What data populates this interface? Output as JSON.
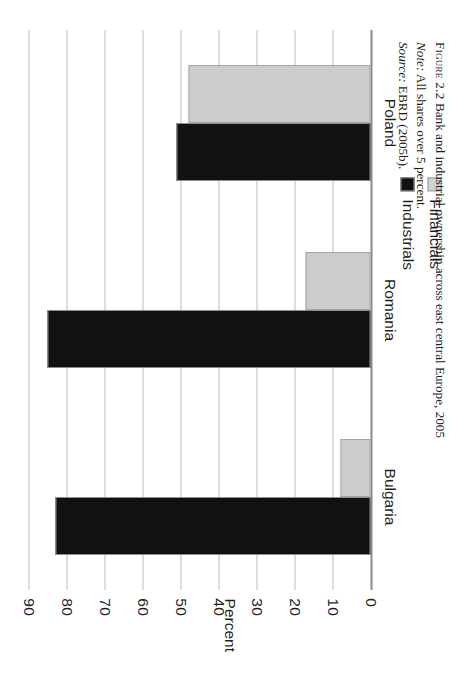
{
  "chart_data": {
    "type": "bar",
    "orientation": "horizontal",
    "title": "Bank and industrial ownership across east central Europe, 2005",
    "categories": [
      "Poland",
      "Romania",
      "Bulgaria"
    ],
    "series": [
      {
        "name": "Industrials",
        "color": "#111111",
        "values": [
          51,
          85,
          83
        ]
      },
      {
        "name": "Financials",
        "color": "#cccccc",
        "values": [
          48,
          17,
          8
        ]
      }
    ],
    "xlabel": "",
    "ylabel": "Percent",
    "ylim": [
      0,
      90
    ],
    "yticks": [
      0,
      10,
      20,
      30,
      40,
      50,
      60,
      70,
      80,
      90
    ],
    "ytick_labels": [
      "0",
      "10",
      "20",
      "30",
      "40",
      "50",
      "60",
      "70",
      "80",
      "90"
    ],
    "grid": true,
    "legend_position": "outside-top"
  },
  "axis": {
    "value_axis_title": "Percent",
    "tick_labels": [
      "90",
      "80",
      "70",
      "60",
      "50",
      "40",
      "30",
      "20",
      "10",
      "0"
    ],
    "category_labels": [
      "Bulgaria",
      "Romania",
      "Poland"
    ]
  },
  "legend": {
    "items": [
      {
        "label": "Industrials",
        "swatch": "industrials-swatch",
        "color": "#111111"
      },
      {
        "label": "Financials",
        "swatch": "financials-swatch",
        "color": "#cccccc"
      }
    ]
  },
  "caption": {
    "figure_tag": "Figure 2.2",
    "figure_title": "Bank and industrial ownership across east central Europe, 2005",
    "note_label": "Note:",
    "note_text": "All shares over 5 percent.",
    "source_label": "Source:",
    "source_text": "EBRD (2005b)."
  }
}
